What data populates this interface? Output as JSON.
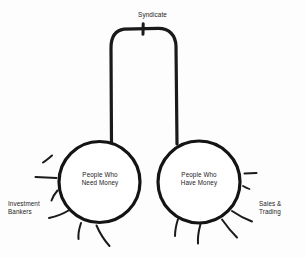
{
  "diagram": {
    "title": "Syndicate",
    "background_color": "#fdfdfd",
    "ink_color": "#1a1a1a",
    "labels": {
      "top_connector": "Syndicate",
      "left_circle": "People Who\nNeed Money",
      "right_circle": "People Who\nHave Money",
      "left_side": "Investment\nBankers",
      "right_side": "Sales &\nTrading"
    },
    "nodes": [
      {
        "id": "left-circle",
        "label": "People Who\nNeed Money",
        "cx": 99.5,
        "cy": 182,
        "r": 40.5
      },
      {
        "id": "right-circle",
        "label": "People Who\nHave Money",
        "cx": 199,
        "cy": 182,
        "r": 41
      }
    ],
    "connector": {
      "label": "Syndicate",
      "shape": "arch",
      "left_leg_x": 111,
      "right_leg_x": 176,
      "top_y": 29,
      "tick_x": 143
    }
  }
}
